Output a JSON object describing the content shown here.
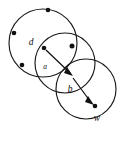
{
  "figure": {
    "name": "three-overlapping-circles-vector-diagram",
    "width": 134,
    "height": 146,
    "background_color": "#ffffff",
    "stroke_color": "#1a1a1a",
    "dot_color": "#111111"
  },
  "labels": {
    "d": "d",
    "a": "a",
    "b": "b",
    "w": "w"
  },
  "circles": [
    {
      "name": "upper-left-circle",
      "cx": 43,
      "cy": 43,
      "r": 34
    },
    {
      "name": "middle-circle",
      "cx": 65,
      "cy": 63,
      "r": 30
    },
    {
      "name": "lower-right-circle",
      "cx": 86,
      "cy": 89,
      "r": 30
    }
  ],
  "points": [
    {
      "name": "point-d",
      "x": 44,
      "y": 48,
      "label": "d",
      "label_x": 33,
      "label_y": 43
    },
    {
      "name": "point-center",
      "x": 73,
      "y": 76,
      "label": "",
      "label_x": 0,
      "label_y": 0
    },
    {
      "name": "point-w",
      "x": 95,
      "y": 106,
      "label": "w",
      "label_x": 96,
      "label_y": 117
    },
    {
      "name": "perimeter-dot-top",
      "x": 48,
      "y": 10,
      "label": "",
      "label_x": 0,
      "label_y": 0
    },
    {
      "name": "perimeter-dot-upper-left",
      "x": 14,
      "y": 33,
      "label": "",
      "label_x": 0,
      "label_y": 0
    },
    {
      "name": "perimeter-dot-lower-left",
      "x": 22,
      "y": 65,
      "label": "",
      "label_x": 0,
      "label_y": 0
    },
    {
      "name": "perimeter-dot-middle-right",
      "x": 72,
      "y": 46,
      "label": "",
      "label_x": 0,
      "label_y": 0
    }
  ],
  "vectors": [
    {
      "name": "vector-d-to-center",
      "x1": 46,
      "y1": 50,
      "x2": 72,
      "y2": 75
    },
    {
      "name": "vector-center-to-w",
      "x1": 73,
      "y1": 78,
      "x2": 93,
      "y2": 104
    }
  ],
  "inner_labels": [
    {
      "name": "label-a",
      "text": "a",
      "x": 45,
      "y": 66
    },
    {
      "name": "label-b",
      "text": "b",
      "x": 70,
      "y": 90
    }
  ]
}
